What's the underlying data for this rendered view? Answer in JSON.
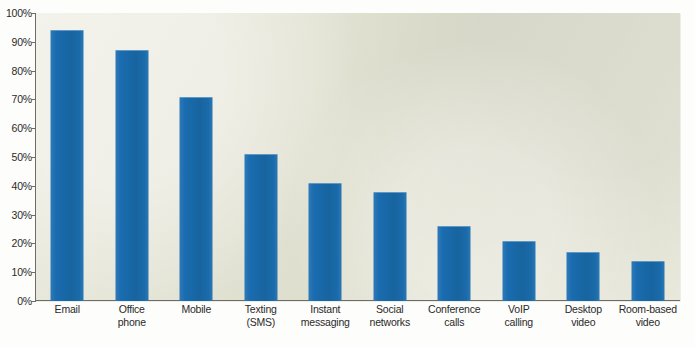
{
  "chart_data": {
    "type": "bar",
    "title": "",
    "subtitle": "",
    "xlabel": "",
    "ylabel": "",
    "ylim": [
      0,
      100
    ],
    "ytick_labels": [
      "100%",
      "90%",
      "80%",
      "70%",
      "60%",
      "50%",
      "40%",
      "30%",
      "20%",
      "10%",
      "0%"
    ],
    "ytick_values": [
      100,
      90,
      80,
      70,
      60,
      50,
      40,
      30,
      20,
      10,
      0
    ],
    "grid": false,
    "legend": "none",
    "value_suffix": "%",
    "categories": [
      "Email",
      "Office phone",
      "Mobile",
      "Texting (SMS)",
      "Instant messaging",
      "Social networks",
      "Conference calls",
      "VoIP calling",
      "Desktop video",
      "Room-based video"
    ],
    "category_lines": [
      [
        "Email",
        ""
      ],
      [
        "Office",
        "phone"
      ],
      [
        "Mobile",
        ""
      ],
      [
        "Texting",
        "(SMS)"
      ],
      [
        "Instant",
        "messaging"
      ],
      [
        "Social",
        "networks"
      ],
      [
        "Conference",
        "calls"
      ],
      [
        "VoIP",
        "calling"
      ],
      [
        "Desktop",
        "video"
      ],
      [
        "Room-based",
        "video"
      ]
    ],
    "values": [
      94,
      87,
      71,
      51,
      41,
      38,
      26,
      21,
      17,
      14
    ]
  },
  "style": {
    "bar_color": "#1a6cb0",
    "bar_highlight": "#2e7ab8",
    "plot_background": "#e3e3d3",
    "page_background": "#fdfdfb",
    "axis_color": "#6d6d63",
    "text_color": "#2a2a2a"
  },
  "footnote": {
    "text": ""
  }
}
